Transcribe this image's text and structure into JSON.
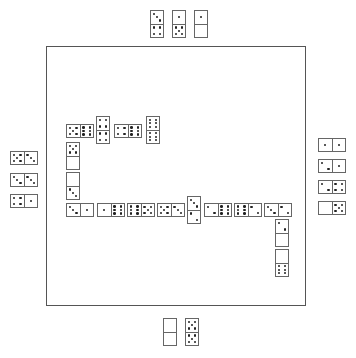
{
  "board": {
    "border_color": "#555555",
    "tiles": [
      {
        "x": 66,
        "y": 124,
        "o": "h",
        "a": 5,
        "b": 6
      },
      {
        "x": 96,
        "y": 116,
        "o": "v",
        "a": 4,
        "b": 4
      },
      {
        "x": 114,
        "y": 124,
        "o": "h",
        "a": 4,
        "b": 6
      },
      {
        "x": 146,
        "y": 116,
        "o": "v",
        "a": 6,
        "b": 6
      },
      {
        "x": 66,
        "y": 142,
        "o": "v",
        "a": 5,
        "b": 0
      },
      {
        "x": 66,
        "y": 172,
        "o": "v",
        "a": 0,
        "b": 3
      },
      {
        "x": 66,
        "y": 203,
        "o": "h",
        "a": 3,
        "b": 1
      },
      {
        "x": 97,
        "y": 203,
        "o": "h",
        "a": 1,
        "b": 6
      },
      {
        "x": 127,
        "y": 203,
        "o": "h",
        "a": 6,
        "b": 5
      },
      {
        "x": 157,
        "y": 203,
        "o": "h",
        "a": 5,
        "b": 3
      },
      {
        "x": 187,
        "y": 196,
        "o": "v",
        "a": 3,
        "b": 2
      },
      {
        "x": 204,
        "y": 203,
        "o": "h",
        "a": 2,
        "b": 6
      },
      {
        "x": 234,
        "y": 203,
        "o": "h",
        "a": 6,
        "b": 2
      },
      {
        "x": 264,
        "y": 203,
        "o": "h",
        "a": 3,
        "b": 2
      },
      {
        "x": 275,
        "y": 219,
        "o": "v",
        "a": 2,
        "b": 0
      },
      {
        "x": 275,
        "y": 249,
        "o": "v",
        "a": 0,
        "b": 6
      }
    ]
  },
  "hands": {
    "top": [
      {
        "x": 150,
        "y": 10,
        "o": "v",
        "a": 3,
        "b": 4
      },
      {
        "x": 172,
        "y": 10,
        "o": "v",
        "a": 1,
        "b": 5
      },
      {
        "x": 194,
        "y": 10,
        "o": "v",
        "a": 1,
        "b": 0
      }
    ],
    "left": [
      {
        "x": 10,
        "y": 151,
        "o": "h",
        "a": 5,
        "b": 3
      },
      {
        "x": 10,
        "y": 173,
        "o": "h",
        "a": 3,
        "b": 3
      },
      {
        "x": 10,
        "y": 194,
        "o": "h",
        "a": 4,
        "b": 1
      }
    ],
    "right": [
      {
        "x": 318,
        "y": 138,
        "o": "h",
        "a": 1,
        "b": 1
      },
      {
        "x": 318,
        "y": 159,
        "o": "h",
        "a": 2,
        "b": 1
      },
      {
        "x": 318,
        "y": 180,
        "o": "h",
        "a": 2,
        "b": 4
      },
      {
        "x": 318,
        "y": 201,
        "o": "h",
        "a": 0,
        "b": 5
      }
    ],
    "bottom": [
      {
        "x": 163,
        "y": 318,
        "o": "v",
        "a": 0,
        "b": 0
      },
      {
        "x": 185,
        "y": 318,
        "o": "v",
        "a": 5,
        "b": 5
      }
    ]
  }
}
